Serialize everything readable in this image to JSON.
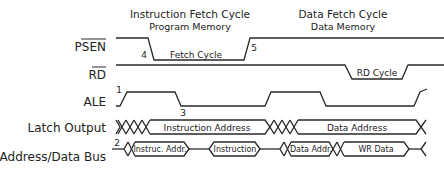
{
  "headers": {
    "instruction_cycle": {
      "title": "Instruction Fetch Cycle",
      "subtitle": "Program Memory"
    },
    "data_cycle": {
      "title": "Data Fetch Cycle",
      "subtitle": "Data Memory"
    }
  },
  "signals": [
    {
      "id": "psen",
      "label": "PSEN",
      "active_low": true
    },
    {
      "id": "rd",
      "label": "RD",
      "active_low": true
    },
    {
      "id": "ale",
      "label": "ALE",
      "active_low": false
    },
    {
      "id": "latch",
      "label": "Latch Output",
      "active_low": false
    },
    {
      "id": "bus",
      "label": "Address/Data Bus",
      "active_low": false
    }
  ],
  "annotations": {
    "psen_low": "Fetch Cycle",
    "rd_low": "RD Cycle",
    "latch_seg1": "Instruction Address",
    "latch_seg2": "Data Address",
    "bus_seg1": "Instruc. Addr.",
    "bus_seg2": "Instruction",
    "bus_seg3": "Data Addr.",
    "bus_seg4": "WR Data"
  },
  "markers": {
    "m1": "1",
    "m2": "2",
    "m3": "3",
    "m4": "4",
    "m5": "5"
  },
  "colors": {
    "line": "#2a2a2a",
    "text": "#222222",
    "background": "#ffffff"
  }
}
